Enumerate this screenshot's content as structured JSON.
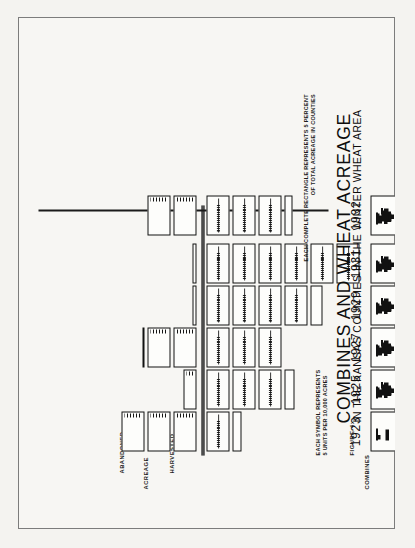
{
  "figure": {
    "number_label": "FIGURE 4:",
    "title": "COMBINES AND WHEAT ACREAGE",
    "subtitle": "IN THE KANSAS COUNTIES IN THE WINTER WHEAT AREA"
  },
  "axis_labels": {
    "acreage": "ACREAGE",
    "harvested": "HARVESTED",
    "abandoned": "ABANDONED",
    "combines": "COMBINES"
  },
  "legends": {
    "combines_line1": "EACH SYMBOL REPRESENTS",
    "combines_line2": "5 UNITS PER 10,000 ACRES",
    "acreage_line1": "EACH COMPLETE RECTANGLE REPRESENTS 5 PERCENT",
    "acreage_line2": "OF TOTAL ACREAGE IN COUNTIES"
  },
  "colors": {
    "ink": "#111111",
    "paper": "#f7f6f3",
    "page_surround": "#f2f1ee",
    "frame": "#7c7c7c",
    "baseline": "#6e6e6e"
  },
  "chart_data": {
    "type": "bar",
    "title": "COMBINES AND WHEAT ACREAGE",
    "subtitle": "IN THE KANSAS COUNTIES IN THE WINTER WHEAT AREA",
    "xlabel": "",
    "ylabel": "",
    "orientation": "pictorial-column, printed rotated 90 degrees",
    "categories": [
      "1923",
      "1925",
      "1927",
      "1929",
      "1931",
      "1932"
    ],
    "units": {
      "combines": "each symbol = 5 units per 10,000 acres",
      "acreage": "each complete rectangle = 5 percent of total acreage in counties"
    },
    "series": [
      {
        "name": "Combines",
        "unit": "symbols",
        "values": [
          0.5,
          1,
          1,
          2.5,
          3,
          4
        ],
        "percent_values": [
          2.5,
          5,
          5,
          12.5,
          15,
          20
        ]
      },
      {
        "name": "Harvested acreage",
        "unit": "rectangles",
        "values": [
          1.5,
          3.5,
          3,
          5,
          6,
          3.5
        ],
        "percent_values": [
          7.5,
          17.5,
          15,
          25,
          30,
          17.5
        ]
      },
      {
        "name": "Abandoned acreage",
        "unit": "rectangles",
        "values": [
          3,
          1,
          2.5,
          0.2,
          0.2,
          2
        ],
        "percent_values": [
          15,
          5,
          12.5,
          1,
          1,
          10
        ]
      }
    ],
    "legend_position": "below plot (two text blocks)",
    "grid": false
  },
  "columns": [
    {
      "year": "1923",
      "combine_symbols": 0.5,
      "harvested": [
        {
          "type": "full"
        },
        {
          "type": "partial",
          "height": 9
        }
      ],
      "abandoned": [
        {
          "type": "full"
        },
        {
          "type": "full"
        },
        {
          "type": "full"
        }
      ]
    },
    {
      "year": "1925",
      "combine_symbols": 1,
      "harvested": [
        {
          "type": "full"
        },
        {
          "type": "full"
        },
        {
          "type": "full"
        },
        {
          "type": "partial",
          "height": 10
        }
      ],
      "abandoned": [
        {
          "type": "partial",
          "height": 13
        }
      ]
    },
    {
      "year": "1927",
      "combine_symbols": 1,
      "harvested": [
        {
          "type": "full"
        },
        {
          "type": "full"
        },
        {
          "type": "full"
        }
      ],
      "abandoned": [
        {
          "type": "full"
        },
        {
          "type": "full"
        },
        {
          "type": "line"
        }
      ]
    },
    {
      "year": "1929",
      "combine_symbols": 2.5,
      "harvested": [
        {
          "type": "full"
        },
        {
          "type": "full"
        },
        {
          "type": "full"
        },
        {
          "type": "full"
        },
        {
          "type": "partial",
          "height": 12
        }
      ],
      "abandoned": [
        {
          "type": "sliver",
          "height": 4
        }
      ]
    },
    {
      "year": "1931",
      "combine_symbols": 3,
      "harvested": [
        {
          "type": "full"
        },
        {
          "type": "full"
        },
        {
          "type": "full"
        },
        {
          "type": "full"
        },
        {
          "type": "full"
        },
        {
          "type": "full"
        }
      ],
      "abandoned": [
        {
          "type": "sliver",
          "height": 4
        }
      ]
    },
    {
      "year": "1932",
      "combine_symbols": 4,
      "harvested": [
        {
          "type": "full"
        },
        {
          "type": "full"
        },
        {
          "type": "full"
        },
        {
          "type": "partial",
          "height": 8
        }
      ],
      "abandoned": [
        {
          "type": "full"
        },
        {
          "type": "full"
        }
      ]
    }
  ]
}
